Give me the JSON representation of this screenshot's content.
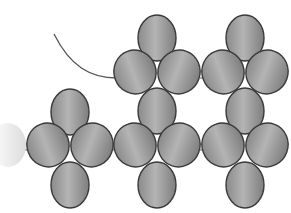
{
  "diagram": {
    "title": "",
    "type": "beadwork-pattern",
    "width": 291,
    "height": 213,
    "colors": {
      "background": "#ffffff",
      "bead_fill_light": "#b4b4b4",
      "bead_fill_dark": "#7e7e7e",
      "bead_outline": "#3a3a3a",
      "thread": "#555555",
      "ghost_bead": "#e6e6e6"
    },
    "thread": {
      "path": "M54 34 C 70 66, 90 78, 117 78"
    },
    "ghost_bead": {
      "cx": 8,
      "cy": 145,
      "rx": 18,
      "ry": 22
    },
    "clusters": [
      {
        "name": "left-cluster",
        "beads": [
          {
            "role": "top",
            "cx": 70,
            "cy": 112,
            "rx": 19,
            "ry": 23,
            "rot": 0
          },
          {
            "role": "left",
            "cx": 48,
            "cy": 145,
            "rx": 21,
            "ry": 22,
            "rot": -20
          },
          {
            "role": "right",
            "cx": 92,
            "cy": 145,
            "rx": 21,
            "ry": 22,
            "rot": 20
          },
          {
            "role": "bottom",
            "cx": 70,
            "cy": 185,
            "rx": 19,
            "ry": 23,
            "rot": 0
          }
        ]
      },
      {
        "name": "middle-top-cluster",
        "beads": [
          {
            "role": "top",
            "cx": 157,
            "cy": 38,
            "rx": 19,
            "ry": 23,
            "rot": 0
          },
          {
            "role": "left",
            "cx": 135,
            "cy": 72,
            "rx": 21,
            "ry": 22,
            "rot": -20
          },
          {
            "role": "right",
            "cx": 179,
            "cy": 72,
            "rx": 21,
            "ry": 22,
            "rot": 20
          }
        ]
      },
      {
        "name": "middle-bottom-cluster",
        "beads": [
          {
            "role": "top",
            "cx": 157,
            "cy": 111,
            "rx": 19,
            "ry": 23,
            "rot": 0
          },
          {
            "role": "left",
            "cx": 135,
            "cy": 145,
            "rx": 21,
            "ry": 22,
            "rot": -20
          },
          {
            "role": "right",
            "cx": 179,
            "cy": 145,
            "rx": 21,
            "ry": 22,
            "rot": 20
          },
          {
            "role": "bottom",
            "cx": 157,
            "cy": 185,
            "rx": 19,
            "ry": 23,
            "rot": 0
          }
        ]
      },
      {
        "name": "right-top-cluster",
        "beads": [
          {
            "role": "top",
            "cx": 245,
            "cy": 38,
            "rx": 19,
            "ry": 23,
            "rot": 0
          },
          {
            "role": "left",
            "cx": 223,
            "cy": 72,
            "rx": 21,
            "ry": 22,
            "rot": -20
          },
          {
            "role": "right",
            "cx": 267,
            "cy": 72,
            "rx": 21,
            "ry": 22,
            "rot": 20
          }
        ]
      },
      {
        "name": "right-bottom-cluster",
        "beads": [
          {
            "role": "top",
            "cx": 245,
            "cy": 111,
            "rx": 19,
            "ry": 23,
            "rot": 0
          },
          {
            "role": "left",
            "cx": 223,
            "cy": 145,
            "rx": 21,
            "ry": 22,
            "rot": -20
          },
          {
            "role": "right",
            "cx": 267,
            "cy": 145,
            "rx": 21,
            "ry": 22,
            "rot": 20
          },
          {
            "role": "bottom",
            "cx": 245,
            "cy": 185,
            "rx": 19,
            "ry": 23,
            "rot": 0
          }
        ]
      }
    ],
    "connectors": [
      {
        "x1": 22,
        "y1": 150,
        "x2": 30,
        "y2": 150
      },
      {
        "x1": 113,
        "y1": 150,
        "x2": 116,
        "y2": 150
      },
      {
        "x1": 200,
        "y1": 150,
        "x2": 203,
        "y2": 150
      },
      {
        "x1": 200,
        "y1": 78,
        "x2": 203,
        "y2": 78
      }
    ]
  }
}
